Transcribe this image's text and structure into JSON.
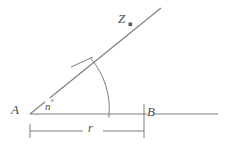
{
  "figure": {
    "type": "geometric-construction",
    "background_color": "#ffffff",
    "line_color": "#7d7d7d",
    "label_color": "#4a4a4a"
  },
  "labels": {
    "vertex_a": "A",
    "point_b": "B",
    "point_z": "Z",
    "angle_value": "n",
    "angle_degree_symbol": "°",
    "radius": "r"
  },
  "geometry": {
    "vertex_a": {
      "x": 30,
      "y": 114
    },
    "point_b": {
      "x": 144,
      "y": 114
    },
    "point_z_dot": {
      "x": 130,
      "y": 24
    },
    "ray_end": {
      "x": 160,
      "y": 9
    },
    "baseline_start": {
      "x": 30,
      "y": 114
    },
    "baseline_end": {
      "x": 218,
      "y": 114
    },
    "arc_radius": 78,
    "angle_degrees": 38,
    "dimension_line_y": 131,
    "dimension_start_x": 30,
    "dimension_end_x": 144
  }
}
